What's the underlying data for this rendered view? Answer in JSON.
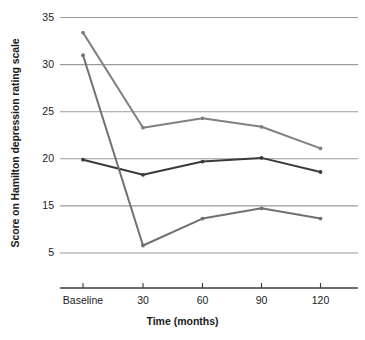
{
  "chart_data": {
    "type": "line",
    "title": "",
    "xlabel": "Time (months)",
    "ylabel": "Score on Hamilton depression rating scale",
    "categories": [
      "Baseline",
      "30",
      "60",
      "90",
      "120"
    ],
    "ytick_labels": [
      "35",
      "30",
      "25",
      "20",
      "15",
      "5"
    ],
    "ytick_values": [
      35,
      30,
      25,
      20,
      15,
      5
    ],
    "ylim": [
      5,
      35
    ],
    "grid": "horizontal",
    "legend": "none",
    "note_axis": "y-axis tick spacing is uniform although the lowest labeled gridline jumps from 15 to 5",
    "series": [
      {
        "name": "series-upper",
        "color": "#808080",
        "values": [
          33.4,
          23.3,
          24.3,
          23.4,
          21.1
        ]
      },
      {
        "name": "series-middle",
        "color": "#3a3a3a",
        "values": [
          19.9,
          18.3,
          19.7,
          20.1,
          18.6
        ]
      },
      {
        "name": "series-lower",
        "color": "#707070",
        "values": [
          31.0,
          6.6,
          12.3,
          14.5,
          12.3
        ]
      }
    ]
  },
  "colors": {
    "gridline": "#9a9a9a",
    "axis": "#3a3a3a",
    "text": "#1a1a1a",
    "background": "#ffffff"
  }
}
